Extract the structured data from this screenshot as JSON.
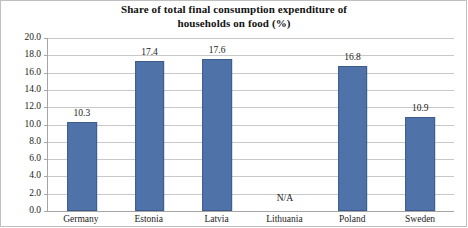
{
  "chart_data": {
    "type": "bar",
    "title": "Share of total final consumption expenditure of households on food (%)",
    "title_line1": "Share of total final consumption expenditure of",
    "title_line2": "households on food (%)",
    "xlabel": "",
    "ylabel": "",
    "ylim": [
      0,
      20
    ],
    "ytick_step": 2,
    "grid": true,
    "legend": false,
    "categories": [
      "Germany",
      "Estonia",
      "Latvia",
      "Lithuania",
      "Poland",
      "Sweden"
    ],
    "values": [
      10.3,
      17.4,
      17.6,
      null,
      16.8,
      10.9
    ],
    "value_labels": [
      "10.3",
      "17.4",
      "17.6",
      "N/A",
      "16.8",
      "10.9"
    ],
    "missing_label": "N/A",
    "ytick_labels": [
      "20.0",
      "18.0",
      "16.0",
      "14.0",
      "12.0",
      "10.0",
      "8.0",
      "6.0",
      "4.0",
      "2.0",
      "0.0"
    ],
    "ytick_values": [
      20,
      18,
      16,
      14,
      12,
      10,
      8,
      6,
      4,
      2,
      0
    ],
    "bar_color": "#4f72a8",
    "bar_border_color": "#3c5c8e",
    "gridline_color": "#c9c9c9",
    "axis_color": "#a6a6a6"
  }
}
